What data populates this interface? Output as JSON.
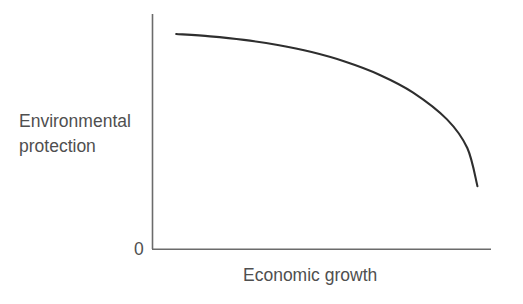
{
  "chart_data": {
    "type": "line",
    "title": "",
    "subtitle": "",
    "xlabel": "Economic growth",
    "ylabel_lines": [
      "Environmental",
      "protection"
    ],
    "ylabel": "Environmental protection",
    "origin_label": "0",
    "grid": false,
    "legend": null,
    "axis_tick_labels": {
      "x": [],
      "y": [
        "0"
      ]
    },
    "xlim": [
      0,
      1
    ],
    "ylim": [
      0,
      1
    ],
    "annotations": [],
    "series": [
      {
        "name": "Trade-off frontier",
        "shape": "concave-decreasing",
        "x": [
          0.07,
          0.17,
          0.27,
          0.37,
          0.47,
          0.57,
          0.67,
          0.77,
          0.87,
          0.93,
          0.96
        ],
        "y": [
          0.915,
          0.905,
          0.89,
          0.868,
          0.838,
          0.797,
          0.742,
          0.666,
          0.552,
          0.43,
          0.268
        ],
        "color": "#2e2e2e",
        "line_width": 2.1
      }
    ],
    "axis_color": "#6b6b6b",
    "text_color": "#4f4f4f",
    "background_color": "#ffffff"
  },
  "figure": {
    "width": 523,
    "height": 304
  }
}
